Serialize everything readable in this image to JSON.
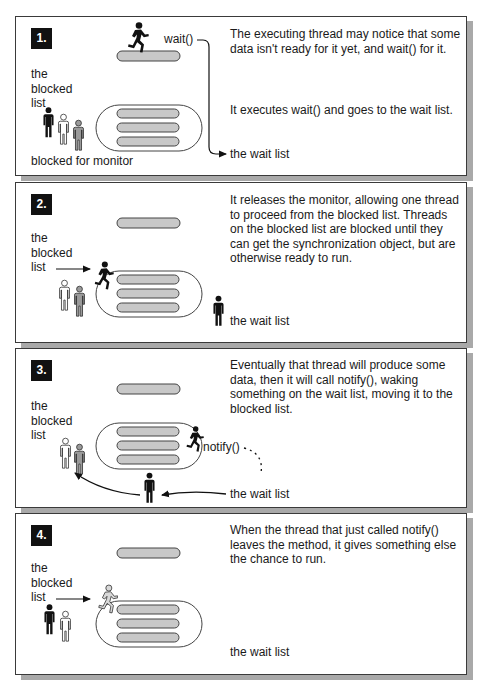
{
  "colors": {
    "badge_bg": "#111111",
    "bar_fill": "#c8c8c8",
    "outline": "#444444",
    "shadow": "#a9a9a9",
    "figure_black": "#111111",
    "figure_gray": "#9a9a9a",
    "figure_white": "#ffffff"
  },
  "panels": [
    {
      "step": "1.",
      "blocked_label": [
        "the",
        "blocked",
        "list"
      ],
      "caption_bottom": "blocked for monitor",
      "call_label": "wait()",
      "wait_list_label": "the wait list",
      "description": [
        "The executing thread may notice that some data isn't ready for it yet, and wait() for it.",
        "It executes wait() and goes to the wait list."
      ],
      "figures": {
        "blocked": [
          "black",
          "white",
          "gray"
        ],
        "running": "black-runner-on-top-bar",
        "wait_list": []
      }
    },
    {
      "step": "2.",
      "blocked_label": [
        "the",
        "blocked",
        "list"
      ],
      "wait_list_label": "the wait list",
      "description": [
        "It releases the monitor, allowing one thread to proceed from the blocked list. Threads on the blocked list are blocked until they can get the synchronization object, but are otherwise ready to run."
      ],
      "figures": {
        "blocked": [
          "white",
          "gray"
        ],
        "running": "black-runner-entering",
        "wait_list": [
          "black"
        ]
      }
    },
    {
      "step": "3.",
      "blocked_label": [
        "the",
        "blocked",
        "list"
      ],
      "call_label": "notify()",
      "wait_list_label": "the wait list",
      "description": [
        "Eventually that thread will produce some data, then it will call notify(), waking something on the wait list, moving it to the blocked list."
      ],
      "figures": {
        "blocked": [
          "white",
          "gray"
        ],
        "running": "black-runner-inside",
        "wait_list": [
          "black-moving-to-blocked"
        ]
      }
    },
    {
      "step": "4.",
      "blocked_label": [
        "the",
        "blocked",
        "list"
      ],
      "wait_list_label": "the wait list",
      "description": [
        "When the thread that just called notify() leaves the method, it gives something else the chance to run."
      ],
      "figures": {
        "blocked": [
          "black",
          "white"
        ],
        "running": "white-runner-entering",
        "wait_list": []
      }
    }
  ]
}
